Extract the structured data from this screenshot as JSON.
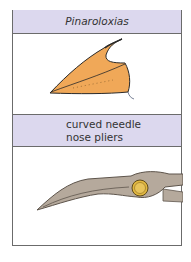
{
  "top": {
    "label": "Pinaroloxias",
    "image": "bird-beak-illustration"
  },
  "bottom": {
    "label_line1": "curved needle",
    "label_line2": "nose pliers",
    "image": "curved-needle-nose-pliers-illustration"
  },
  "colors": {
    "band": "#dcd8ee",
    "border": "#6b6b6b",
    "beak": "#f0a858",
    "pliers": "#b5a99c",
    "pivot": "#e2b840"
  }
}
